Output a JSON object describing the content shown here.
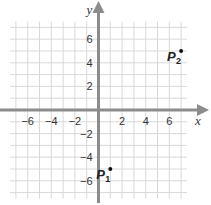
{
  "chart_data": {
    "type": "scatter",
    "title": "",
    "xlabel": "x",
    "ylabel": "y",
    "xlim": [
      -7.5,
      7.5
    ],
    "ylim": [
      -7.5,
      7.5
    ],
    "grid": true,
    "grid_step": 1,
    "x_ticks": [
      -6,
      -4,
      -2,
      2,
      4,
      6
    ],
    "y_ticks": [
      -6,
      -4,
      -2,
      2,
      4,
      6
    ],
    "x_tick_labels": [
      "−6",
      "−4",
      "−2",
      "2",
      "4",
      "6"
    ],
    "y_tick_labels": [
      "−6",
      "−4",
      "−2",
      "2",
      "4",
      "6"
    ],
    "points": [
      {
        "name": "P1",
        "label": "P",
        "subscript": "1",
        "x": 1,
        "y": -5
      },
      {
        "name": "P2",
        "label": "P",
        "subscript": "2",
        "x": 7,
        "y": 5
      }
    ],
    "legend": null
  },
  "colors": {
    "grid": "#d9d9d9",
    "axis": "#8c8c8c",
    "point": "#111111",
    "text": "#333333",
    "background": "#ffffff"
  },
  "layout": {
    "origin_px": [
      98.5,
      110
    ],
    "unit_px": 11.8
  }
}
